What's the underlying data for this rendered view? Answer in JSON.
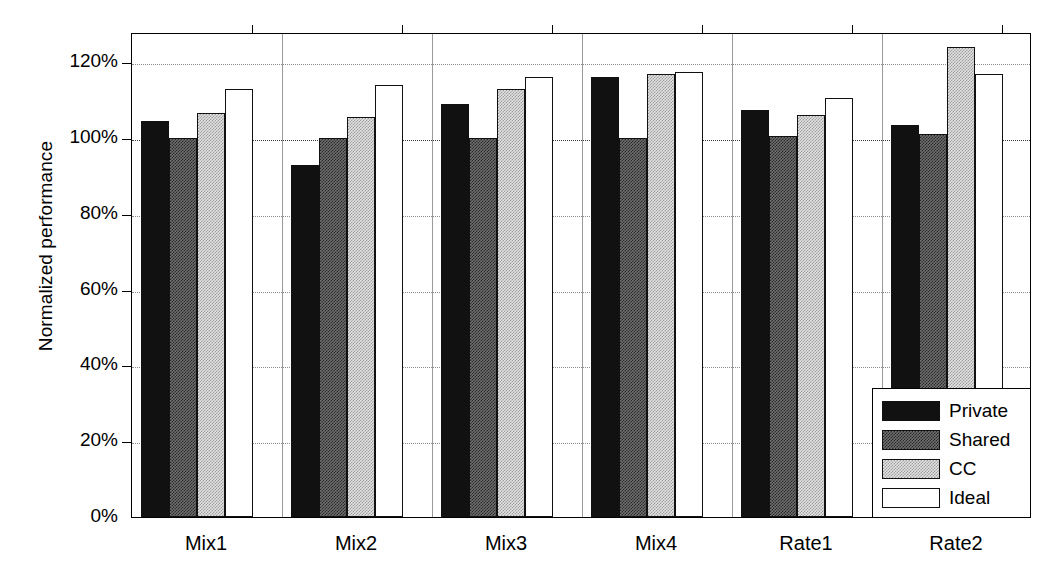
{
  "chart_data": {
    "type": "bar",
    "title": "",
    "xlabel": "",
    "ylabel": "Normalized performance",
    "categories": [
      "Mix1",
      "Mix2",
      "Mix3",
      "Mix4",
      "Rate1",
      "Rate2"
    ],
    "series": [
      {
        "name": "Private",
        "values": [
          104.5,
          93.0,
          109.0,
          116.0,
          107.5,
          103.5
        ]
      },
      {
        "name": "Shared",
        "values": [
          100.0,
          100.0,
          100.0,
          100.0,
          100.5,
          101.0
        ]
      },
      {
        "name": "CC",
        "values": [
          106.5,
          105.5,
          113.0,
          117.0,
          106.0,
          124.0
        ]
      },
      {
        "name": "Ideal",
        "values": [
          113.0,
          114.0,
          116.0,
          117.5,
          110.5,
          117.0
        ]
      }
    ],
    "ylim": [
      0,
      128
    ],
    "yticks": [
      0,
      20,
      40,
      60,
      80,
      100,
      120
    ],
    "ytick_labels": [
      "0%",
      "20%",
      "40%",
      "60%",
      "80%",
      "100%",
      "120%"
    ],
    "reference_line": 100,
    "grid": true,
    "legend_position": "lower-right",
    "units": "percent"
  },
  "legend": {
    "entries": [
      {
        "label": "Private",
        "style": "solid-black",
        "color": "#111111"
      },
      {
        "label": "Shared",
        "style": "dark-hatch",
        "color": "#6f6f6f"
      },
      {
        "label": "CC",
        "style": "light-hatch",
        "color": "#e3e3e3"
      },
      {
        "label": "Ideal",
        "style": "empty-white",
        "color": "#ffffff"
      }
    ]
  }
}
